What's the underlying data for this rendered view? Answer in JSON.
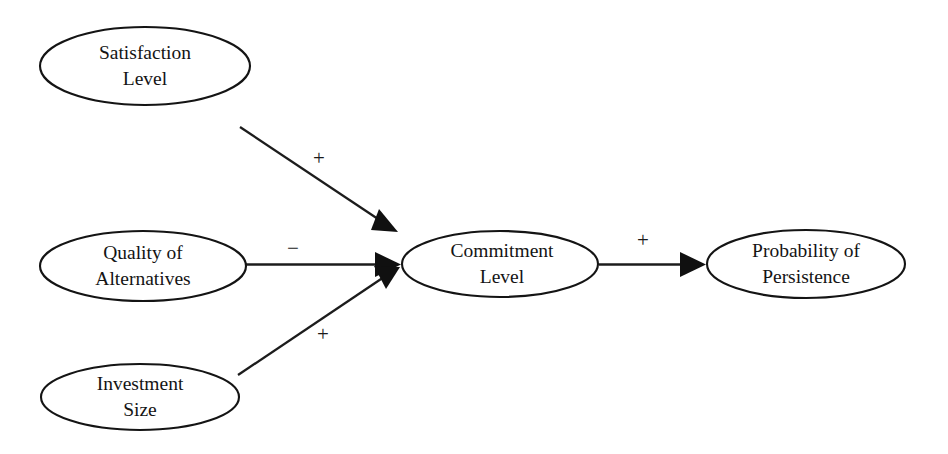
{
  "diagram": {
    "type": "path-diagram",
    "background_color": "#ffffff",
    "line_color": "#1c1c1c",
    "text_color": "#141414",
    "nodes": [
      {
        "id": "satisfaction-level",
        "label_line1": "Satisfaction",
        "label_line2": "Level",
        "shape": "ellipse",
        "cx": 145,
        "cy": 66,
        "rx": 105,
        "ry": 39
      },
      {
        "id": "quality-of-alternatives",
        "label_line1": "Quality of",
        "label_line2": "Alternatives",
        "shape": "ellipse",
        "cx": 143,
        "cy": 266,
        "rx": 103,
        "ry": 35
      },
      {
        "id": "investment-size",
        "label_line1": "Investment",
        "label_line2": "Size",
        "shape": "ellipse",
        "cx": 140,
        "cy": 397,
        "rx": 99,
        "ry": 33
      },
      {
        "id": "commitment-level",
        "label_line1": "Commitment",
        "label_line2": "Level",
        "shape": "ellipse",
        "cx": 500,
        "cy": 264,
        "rx": 98,
        "ry": 33
      },
      {
        "id": "probability-of-persistence",
        "label_line1": "Probability of",
        "label_line2": "Persistence",
        "shape": "ellipse",
        "cx": 806,
        "cy": 264,
        "rx": 99,
        "ry": 34
      }
    ],
    "edges": [
      {
        "id": "satisfaction-to-commitment",
        "from": "satisfaction-level",
        "to": "commitment-level",
        "sign": "+",
        "sign_x": 319,
        "sign_y": 160,
        "x1": 240,
        "y1": 127,
        "x2": 396,
        "y2": 231
      },
      {
        "id": "alternatives-to-commitment",
        "from": "quality-of-alternatives",
        "to": "commitment-level",
        "sign": "−",
        "sign_x": 293,
        "sign_y": 250,
        "x1": 246,
        "y1": 264,
        "x2": 400,
        "y2": 264
      },
      {
        "id": "investment-to-commitment",
        "from": "investment-size",
        "to": "commitment-level",
        "sign": "+",
        "sign_x": 323,
        "sign_y": 336,
        "x1": 238,
        "y1": 375,
        "x2": 399,
        "y2": 272
      },
      {
        "id": "commitment-to-persistence",
        "from": "commitment-level",
        "to": "probability-of-persistence",
        "sign": "+",
        "sign_x": 643,
        "sign_y": 242,
        "x1": 599,
        "y1": 264,
        "x2": 705,
        "y2": 264
      }
    ]
  }
}
